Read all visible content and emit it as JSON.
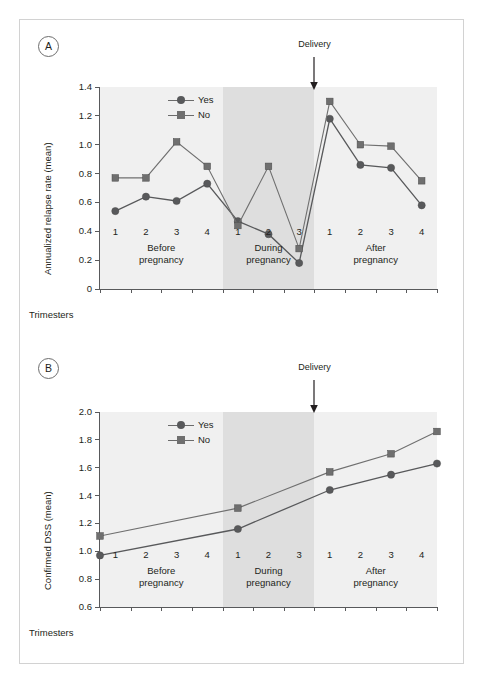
{
  "figure": {
    "panels": [
      {
        "tag": "A"
      },
      {
        "tag": "B"
      }
    ],
    "delivery_annotation": "Delivery",
    "trimesters_label": "Trimesters",
    "period_labels": [
      "Before pregnancy",
      "During pregnancy",
      "After pregnancy"
    ],
    "colors": {
      "series_yes": "#58595b",
      "series_no": "#6f6f6f",
      "band_light": "#f0f0f0",
      "band_dark": "#dedede",
      "axis": "#58595b",
      "frame": "#d2d2d2"
    }
  },
  "chart_data": [
    {
      "type": "line",
      "panel": "A",
      "title": "",
      "xlabel": "Trimesters",
      "ylabel": "Annualized relapse rate (mean)",
      "ylim": [
        0,
        1.4
      ],
      "yticks": [
        0,
        0.2,
        0.4,
        0.6,
        0.8,
        1.0,
        1.2,
        1.4
      ],
      "ytick_labels": [
        "0",
        "0.2",
        "0.4",
        "0.6",
        "0.8",
        "1.0",
        "1.2",
        "1.4"
      ],
      "grid": false,
      "legend_position": "top-left",
      "x": [
        "B1",
        "B2",
        "B3",
        "B4",
        "D1",
        "D2",
        "D3",
        "A1",
        "A2",
        "A3",
        "A4"
      ],
      "xtick_labels": [
        "1",
        "2",
        "3",
        "4",
        "1",
        "2",
        "3",
        "1",
        "2",
        "3",
        "4"
      ],
      "regions": [
        {
          "label": "Before pregnancy",
          "count": 4,
          "shade": "light"
        },
        {
          "label": "During pregnancy",
          "count": 3,
          "shade": "dark"
        },
        {
          "label": "After pregnancy",
          "count": 4,
          "shade": "light"
        }
      ],
      "series": [
        {
          "name": "Yes",
          "marker": "circle",
          "values": [
            0.54,
            0.64,
            0.61,
            0.73,
            0.47,
            0.38,
            0.18,
            1.18,
            0.86,
            0.84,
            0.58
          ]
        },
        {
          "name": "No",
          "marker": "square",
          "values": [
            0.77,
            0.77,
            1.02,
            0.85,
            0.44,
            0.85,
            0.28,
            1.3,
            1.0,
            0.99,
            0.75
          ]
        }
      ],
      "annotations": [
        {
          "text": "Delivery",
          "at_x": "D3-A1 boundary"
        }
      ]
    },
    {
      "type": "line",
      "panel": "B",
      "title": "",
      "xlabel": "Trimesters",
      "ylabel": "Confirmed DSS (mean)",
      "ylim": [
        0.6,
        2.0
      ],
      "yticks": [
        0.6,
        0.8,
        1.0,
        1.2,
        1.4,
        1.6,
        1.8,
        2.0
      ],
      "ytick_labels": [
        "0.6",
        "0.8",
        "1.0",
        "1.2",
        "1.4",
        "1.6",
        "1.8",
        "2.0"
      ],
      "grid": false,
      "legend_position": "top-left",
      "x": [
        "B1",
        "B2",
        "B3",
        "B4",
        "D1",
        "D2",
        "D3",
        "A1",
        "A2",
        "A3",
        "A4"
      ],
      "xtick_labels": [
        "1",
        "2",
        "3",
        "4",
        "1",
        "2",
        "3",
        "1",
        "2",
        "3",
        "4"
      ],
      "regions": [
        {
          "label": "Before pregnancy",
          "count": 4,
          "shade": "light"
        },
        {
          "label": "During pregnancy",
          "count": 3,
          "shade": "dark"
        },
        {
          "label": "After pregnancy",
          "count": 4,
          "shade": "light"
        }
      ],
      "marker_positions": [
        0.0,
        4.5,
        7.5,
        9.5,
        11.0
      ],
      "series": [
        {
          "name": "Yes",
          "marker": "circle",
          "values": [
            0.97,
            1.16,
            1.44,
            1.55,
            1.63
          ]
        },
        {
          "name": "No",
          "marker": "square",
          "values": [
            1.11,
            1.31,
            1.57,
            1.7,
            1.86
          ]
        }
      ],
      "annotations": [
        {
          "text": "Delivery",
          "at_x": "D3-A1 boundary"
        }
      ]
    }
  ]
}
